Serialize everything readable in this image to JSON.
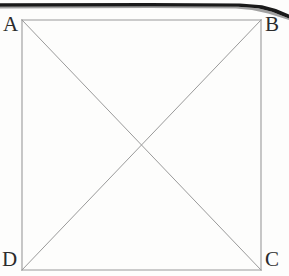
{
  "figure": {
    "name": "square-abcd-with-diagonals",
    "caption": "",
    "background_color": "#fdfdfc",
    "stroke_color": "#9a9a9a",
    "label_color": "#2b2b2b",
    "page_edge_color": "#1a1a1a"
  },
  "labels": {
    "a": "A",
    "b": "B",
    "c": "C",
    "d": "D"
  },
  "chart_data": {
    "type": "diagram",
    "title": "",
    "shape": "square",
    "vertices": [
      {
        "label": "A",
        "x": 22,
        "y": 20,
        "position": "top-left"
      },
      {
        "label": "B",
        "x": 261,
        "y": 20,
        "position": "top-right"
      },
      {
        "label": "C",
        "x": 261,
        "y": 270,
        "position": "bottom-right"
      },
      {
        "label": "D",
        "x": 22,
        "y": 270,
        "position": "bottom-left"
      }
    ],
    "edges": [
      {
        "name": "AB",
        "from": "A",
        "to": "B"
      },
      {
        "name": "BC",
        "from": "B",
        "to": "C"
      },
      {
        "name": "CD",
        "from": "C",
        "to": "D"
      },
      {
        "name": "DA",
        "from": "D",
        "to": "A"
      }
    ],
    "diagonals": [
      {
        "name": "AC",
        "from": "A",
        "to": "C"
      },
      {
        "name": "BD",
        "from": "B",
        "to": "D"
      }
    ],
    "intersection": {
      "label": "",
      "x": 141.5,
      "y": 145
    },
    "stroke_width": 1,
    "grid": false,
    "legend": false
  },
  "artifacts": {
    "page_edge": {
      "name": "scanned-page-edge",
      "description": "Thick dark horizontal band across the top of the scan, thickening and curving down at the right edge."
    },
    "bleed_through": [
      {
        "text": "",
        "x": 40,
        "y": 62
      },
      {
        "text": "",
        "x": 120,
        "y": 66
      },
      {
        "text": "",
        "x": 190,
        "y": 70
      },
      {
        "text": "",
        "x": 130,
        "y": 138
      },
      {
        "text": "",
        "x": 30,
        "y": 206
      },
      {
        "text": "",
        "x": 160,
        "y": 210
      }
    ]
  }
}
